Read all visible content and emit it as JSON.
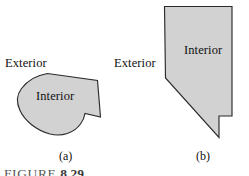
{
  "figure": {
    "caption_word": "FIGURE",
    "caption_number": "8.29",
    "background_color": "#ffffff",
    "shape_fill_color": "#d2d2d2",
    "shape_stroke_color": "#2b2b2b",
    "label_color": "#111111"
  },
  "panels": [
    {
      "id": "a",
      "caption": "(a)",
      "exterior_label": "Exterior",
      "interior_label": "Interior",
      "shape_name": "rounded-blob-polygon",
      "path": "M 47.5 73.5 C 38 75 28 80 21.5 88.5 C 16.5 95 16.5 103 20 110.5 C 25 121 36 130 50 134 C 62 137 74 133 80.5 124 C 83 120.5 84.5 117 85 113.5 L 100.5 117 L 97.5 80.5 Z"
    },
    {
      "id": "b",
      "caption": "(b)",
      "exterior_label": "Exterior",
      "interior_label": "Interior",
      "shape_name": "nevada-polygon",
      "path": "M 164.5 6.5 L 232.0 6.5 L 232.0 116.0 L 219.0 116.0 L 219.0 137.5 L 165.5 78.0 Z"
    }
  ]
}
